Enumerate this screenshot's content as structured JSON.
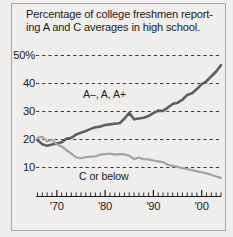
{
  "figure": {
    "title_line1": "Percentage of college freshmen report-",
    "title_line2": "ing A and C averages in high school.",
    "background_color": "#efeeec",
    "frame_color": "#a8a6a2"
  },
  "chart_data": {
    "type": "line",
    "xlabel": "",
    "ylabel": "",
    "ylim": [
      5,
      52
    ],
    "xlim": [
      1966,
      2004
    ],
    "grid": true,
    "grid_style": "dashed-horizontal",
    "legend_position": "inline-annotation",
    "ytick_labels": [
      "50%",
      "40",
      "30",
      "20",
      "10"
    ],
    "ytick_values": [
      50,
      40,
      30,
      20,
      10
    ],
    "xtick_labels": [
      "'70",
      "'80",
      "'90",
      "'00"
    ],
    "xtick_values": [
      1970,
      1980,
      1990,
      2000
    ],
    "minor_xticks": "every year",
    "x": [
      1966,
      1967,
      1968,
      1969,
      1970,
      1971,
      1972,
      1973,
      1974,
      1975,
      1976,
      1977,
      1978,
      1979,
      1980,
      1981,
      1982,
      1983,
      1984,
      1985,
      1986,
      1987,
      1988,
      1989,
      1990,
      1991,
      1992,
      1993,
      1994,
      1995,
      1996,
      1997,
      1998,
      1999,
      2000,
      2001,
      2002,
      2003,
      2004
    ],
    "series": [
      {
        "name": "A-, A, A+",
        "label": "A–, A, A+",
        "color": "#5e5e5e",
        "width": 2.6,
        "values": [
          19.8,
          18.3,
          17.8,
          18.2,
          18.6,
          19.0,
          20.3,
          20.6,
          21.8,
          22.4,
          23.0,
          23.8,
          24.4,
          24.6,
          25.2,
          25.4,
          25.6,
          25.8,
          27.4,
          29.5,
          27.2,
          27.5,
          27.8,
          28.4,
          29.4,
          30.3,
          30.2,
          31.4,
          32.7,
          33.1,
          34.2,
          35.9,
          36.5,
          38.0,
          39.8,
          40.8,
          42.6,
          44.3,
          46.6
        ]
      },
      {
        "name": "C or below",
        "label": "C or below",
        "color": "#a3a3a3",
        "width": 2.2,
        "values": [
          20.6,
          21.0,
          19.3,
          19.9,
          18.3,
          17.5,
          16.2,
          15.0,
          13.6,
          13.3,
          13.7,
          13.9,
          14.0,
          14.6,
          14.8,
          15.0,
          14.6,
          14.8,
          14.7,
          14.2,
          13.0,
          13.6,
          13.0,
          12.9,
          12.5,
          12.2,
          11.9,
          11.0,
          10.6,
          10.2,
          9.8,
          9.4,
          9.1,
          8.6,
          8.3,
          7.9,
          7.4,
          6.8,
          6.3
        ]
      }
    ],
    "annotations": [
      {
        "text": "A–, A, A+",
        "series": "A-, A, A+"
      },
      {
        "text": "C or below",
        "series": "C or below"
      }
    ]
  }
}
